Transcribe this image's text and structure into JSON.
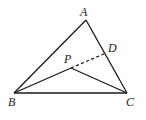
{
  "figure": {
    "type": "geometry",
    "stroke_color": "#1a1a1a",
    "points": {
      "A": {
        "label": "A",
        "x": 86,
        "y": 20
      },
      "B": {
        "label": "B",
        "x": 14,
        "y": 93
      },
      "C": {
        "label": "C",
        "x": 127,
        "y": 93
      },
      "P": {
        "label": "P",
        "x": 71,
        "y": 68
      },
      "D": {
        "label": "D",
        "x": 106,
        "y": 53
      }
    },
    "segments": [
      {
        "from": "A",
        "to": "B",
        "style": "solid"
      },
      {
        "from": "A",
        "to": "C",
        "style": "solid"
      },
      {
        "from": "B",
        "to": "C",
        "style": "solid"
      },
      {
        "from": "B",
        "to": "P",
        "style": "solid"
      },
      {
        "from": "P",
        "to": "C",
        "style": "solid"
      },
      {
        "from": "P",
        "to": "D",
        "style": "dashed"
      }
    ]
  },
  "labels": {
    "A": "A",
    "B": "B",
    "C": "C",
    "P": "P",
    "D": "D"
  }
}
